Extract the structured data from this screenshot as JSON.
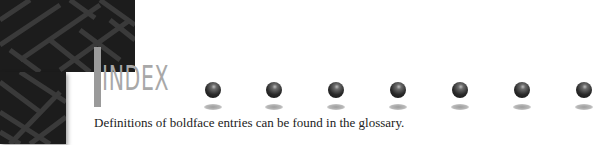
{
  "header": {
    "title": "INDEX",
    "decoration": "maze-pattern-image",
    "bullets": [
      {
        "icon": "sphere-icon",
        "x": 213
      },
      {
        "icon": "sphere-icon",
        "x": 274
      },
      {
        "icon": "sphere-icon",
        "x": 336
      },
      {
        "icon": "sphere-icon",
        "x": 398
      },
      {
        "icon": "sphere-icon",
        "x": 460
      },
      {
        "icon": "sphere-icon",
        "x": 522
      },
      {
        "icon": "sphere-icon",
        "x": 584
      }
    ]
  },
  "body": {
    "note": "Definitions of boldface entries can be found in the glossary."
  },
  "colors": {
    "maze_bg": "#1c1c1c",
    "title": "#a8a8a8",
    "bar": "#9a9a9a",
    "text": "#222222"
  }
}
